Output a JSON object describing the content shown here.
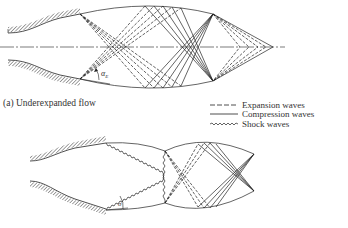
{
  "figure": {
    "panel_a": {
      "caption": "(a) Underexpanded flow",
      "angle_label": "α",
      "angle_subscript": "E"
    },
    "panel_b": {
      "angle_label": "σ"
    },
    "legend": {
      "items": [
        {
          "style": "dashed",
          "label": "Expansion waves"
        },
        {
          "style": "solid",
          "label": "Compression waves"
        },
        {
          "style": "zigzag",
          "label": "Shock waves"
        }
      ]
    },
    "colors": {
      "ink": "#222222",
      "background": "#ffffff"
    }
  }
}
